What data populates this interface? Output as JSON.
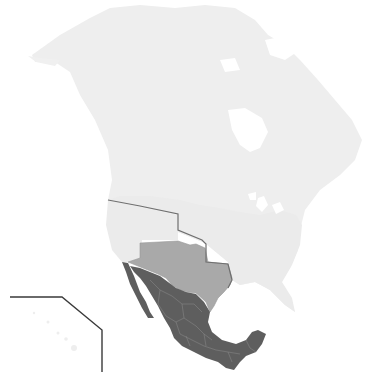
{
  "map": {
    "type": "thematic-map",
    "region": "North America",
    "legend": [],
    "colors": {
      "background": "#ffffff",
      "land_base": "#ececec",
      "land_base_alt": "#f1f1f1",
      "highlight_light": "#a9a9a9",
      "highlight_dark": "#5e5e5e",
      "border_line": "#6f6f6f",
      "internal_borders": "#8a8a8a"
    },
    "regions": [
      {
        "id": "north-america-base",
        "shade": "very light gray"
      },
      {
        "id": "ceded-territory",
        "shade": "medium gray"
      },
      {
        "id": "mexico",
        "shade": "dark gray",
        "subdivisions_shown": true
      }
    ],
    "inset": {
      "id": "hawaii-inset",
      "frame": "angled corner line"
    }
  }
}
